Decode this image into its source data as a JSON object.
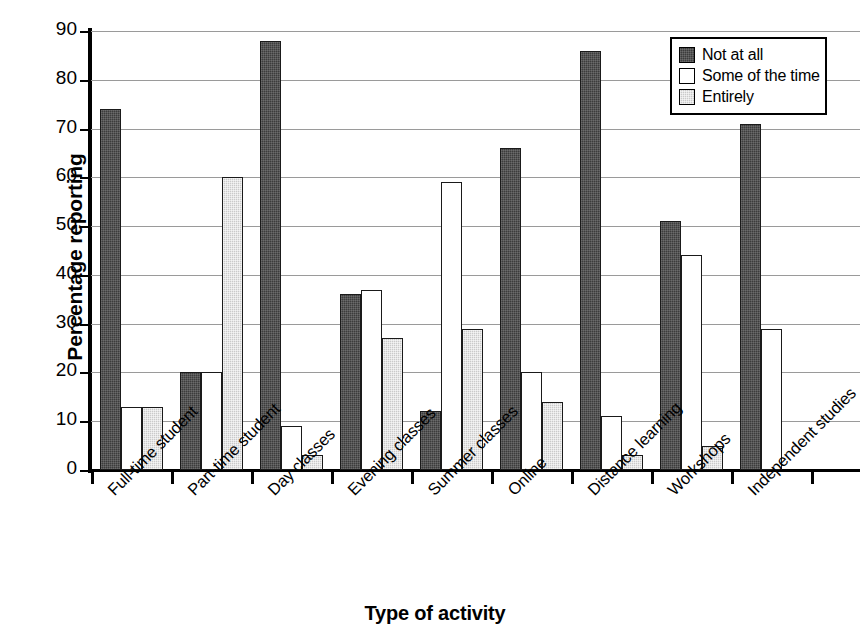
{
  "chart_data": {
    "type": "bar",
    "title": "",
    "xlabel": "Type of activity",
    "ylabel": "Percentage reporting",
    "ylim": [
      0,
      90
    ],
    "ytick_step": 10,
    "yticks": [
      0,
      10,
      20,
      30,
      40,
      50,
      60,
      70,
      80,
      90
    ],
    "grid": true,
    "legend_position": "top-right",
    "categories": [
      "Full-time student",
      "Part-time student",
      "Day classes",
      "Evening classes",
      "Summer classes",
      "Online",
      "Distance learning",
      "Workshops",
      "Independent studies"
    ],
    "series": [
      {
        "name": "Not at all",
        "color": "#3c3c3c",
        "values": [
          74,
          20,
          88,
          36,
          12,
          66,
          86,
          51,
          71
        ]
      },
      {
        "name": "Some of the time",
        "color": "#ffffff",
        "values": [
          13,
          20,
          9,
          37,
          59,
          20,
          11,
          44,
          29
        ]
      },
      {
        "name": "Entirely",
        "color": "#cacaca",
        "values": [
          13,
          60,
          3,
          27,
          29,
          14,
          3,
          5,
          null
        ]
      }
    ]
  },
  "legend": {
    "items": [
      {
        "label": "Not at all",
        "swatch": "dark"
      },
      {
        "label": "Some of the time",
        "swatch": "white"
      },
      {
        "label": "Entirely",
        "swatch": "gray"
      }
    ]
  }
}
